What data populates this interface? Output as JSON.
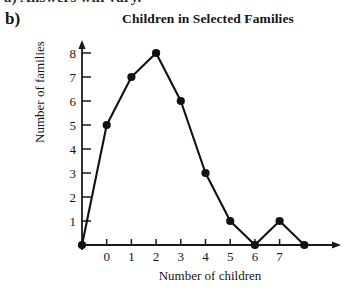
{
  "page": {
    "clipped_top_line": "a)  Answers will vary.",
    "part_label": "b)"
  },
  "chart_data": {
    "type": "line",
    "title": "Children in Selected Families",
    "xlabel": "Number of children",
    "ylabel": "Number of families",
    "x": [
      -1,
      0,
      1,
      2,
      3,
      4,
      5,
      6,
      7,
      8
    ],
    "values": [
      0,
      5,
      7,
      8,
      6,
      3,
      1,
      0,
      1,
      0
    ],
    "xtick_labels": [
      "0",
      "1",
      "2",
      "3",
      "4",
      "5",
      "6",
      "7"
    ],
    "xtick_values": [
      0,
      1,
      2,
      3,
      4,
      5,
      6,
      7
    ],
    "ytick_labels": [
      "1",
      "2",
      "3",
      "4",
      "5",
      "6",
      "7",
      "8"
    ],
    "ytick_values": [
      1,
      2,
      3,
      4,
      5,
      6,
      7,
      8
    ],
    "xlim": [
      -1.3,
      9.0
    ],
    "ylim": [
      0,
      8.6
    ],
    "grid": false,
    "legend": null,
    "marker": "filled-circle",
    "line_color": "#111111",
    "marker_color": "#111111",
    "axis_color": "#1a1a1a",
    "background": "#ffffff",
    "axis_arrows": true
  }
}
